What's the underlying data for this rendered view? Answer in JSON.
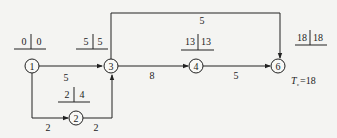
{
  "diagram": {
    "type": "activity-on-arrow network",
    "nodes": [
      {
        "id": "1",
        "label": "1",
        "x": 32,
        "y": 66,
        "et": "0",
        "lt": "0",
        "tx": 32,
        "ty": 27
      },
      {
        "id": "2",
        "label": "2",
        "x": 76,
        "y": 118,
        "et": "2",
        "lt": "4",
        "tx": 74,
        "ty": 97
      },
      {
        "id": "3",
        "label": "3",
        "x": 110,
        "y": 66,
        "et": "5",
        "lt": "5",
        "tx": 93,
        "ty": 27
      },
      {
        "id": "4",
        "label": "4",
        "x": 196,
        "y": 66,
        "et": "13",
        "lt": "13",
        "tx": 198,
        "ty": 27
      },
      {
        "id": "6",
        "label": "6",
        "x": 278,
        "y": 66,
        "et": "18",
        "lt": "18",
        "tx": 305,
        "ty": 25
      }
    ],
    "arrows": [
      {
        "from": "1",
        "to": "3",
        "duration": "5"
      },
      {
        "from": "1",
        "to": "2",
        "duration": "2"
      },
      {
        "from": "2",
        "to": "3",
        "duration": "2"
      },
      {
        "from": "3",
        "to": "4",
        "duration": "8"
      },
      {
        "from": "4",
        "to": "6",
        "duration": "5"
      },
      {
        "from": "3",
        "to": "6",
        "duration": "5"
      }
    ],
    "calc_period": {
      "symbol": "T",
      "subscript": "c",
      "value": "=18"
    }
  }
}
